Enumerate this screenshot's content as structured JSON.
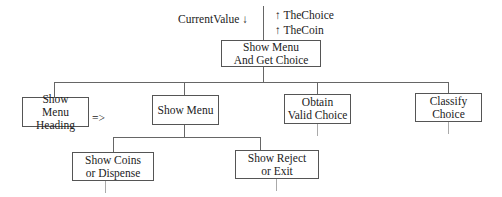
{
  "diagram": {
    "top_params": {
      "input": {
        "name": "CurrentValue",
        "arrow": "↓"
      },
      "outputs": [
        {
          "arrow": "↑",
          "name": "TheChoice"
        },
        {
          "arrow": "↑",
          "name": "TheCoin"
        }
      ]
    },
    "root": {
      "line1": "Show Menu",
      "line2": "And Get Choice"
    },
    "level1": [
      {
        "line1": "Show",
        "line2": "Menu Heading",
        "suffix": "=>"
      },
      {
        "line1": "Show Menu",
        "line2": ""
      },
      {
        "line1": "Obtain",
        "line2": "Valid Choice"
      },
      {
        "line1": "Classify",
        "line2": "Choice"
      }
    ],
    "level2": [
      {
        "line1": "Show Coins",
        "line2": "or Dispense"
      },
      {
        "line1": "Show Reject",
        "line2": "or Exit"
      }
    ]
  }
}
